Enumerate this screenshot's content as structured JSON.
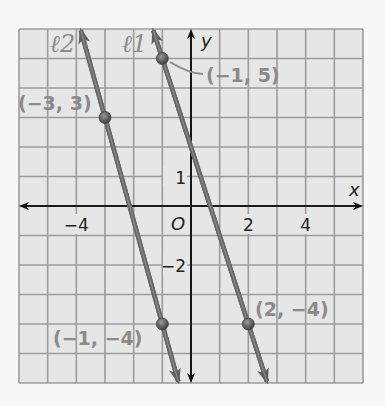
{
  "chart_data": {
    "type": "line",
    "title": "",
    "xlabel": "x",
    "ylabel": "y",
    "xlim": [
      -6,
      6
    ],
    "ylim": [
      -6,
      6
    ],
    "grid": true,
    "origin_label": "O",
    "x_ticks": [
      {
        "value": -4,
        "label": "−4"
      },
      {
        "value": 2,
        "label": "2"
      },
      {
        "value": 4,
        "label": "4"
      }
    ],
    "y_ticks": [
      {
        "value": 1,
        "label": "1"
      },
      {
        "value": -2,
        "label": "−2"
      }
    ],
    "series": [
      {
        "name": "ℓ1",
        "points": [
          {
            "x": -1,
            "y": 5,
            "label": "(−1, 5)"
          },
          {
            "x": 2,
            "y": -4,
            "label": "(2, −4)"
          }
        ],
        "slope": -3
      },
      {
        "name": "ℓ2",
        "points": [
          {
            "x": -3,
            "y": 3,
            "label": "(−3, 3)"
          },
          {
            "x": -1,
            "y": -4,
            "label": "(−1, −4)"
          }
        ],
        "slope": -3.5
      }
    ]
  },
  "colors": {
    "background": "#f7f7f7",
    "grid_fill": "#e6e6e6",
    "grid_line": "#9c9c9c",
    "axis": "#111111",
    "line": "#666666",
    "label": "#8a8a8a"
  }
}
